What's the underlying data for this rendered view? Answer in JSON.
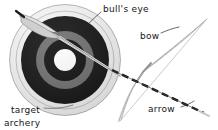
{
  "figure": {
    "caption": "archery",
    "background_color": "#ffffff",
    "text_color": "#141414"
  },
  "labels": {
    "bullseye": "bull's eye",
    "bow": "bow",
    "arrow": "arrow",
    "target": "target"
  },
  "diagram": {
    "title": "archery",
    "type": "labeled-illustration",
    "parts": [
      {
        "name": "target",
        "label": "target",
        "label_position": "bottom-left",
        "description": "concentric ring archery target seen slightly obliquely",
        "center": [
          65,
          60
        ],
        "rings": [
          {
            "name": "outer-edge",
            "radius": 56,
            "color": "#ffffff",
            "stroke": "#8a8a8a"
          },
          {
            "name": "outer-white",
            "radius": 49,
            "color": "#fbfbfb",
            "stroke": "#9a9a9a"
          },
          {
            "name": "outer-black",
            "radius": 44,
            "color": "#111111"
          },
          {
            "name": "mid-gray",
            "radius": 29,
            "color": "#6f6f6f"
          },
          {
            "name": "inner-black",
            "radius": 21,
            "color": "#0d0d0d"
          },
          {
            "name": "bulls-eye-center",
            "radius": 11,
            "color": "#fdfdfd"
          }
        ]
      },
      {
        "name": "bulls-eye",
        "label": "bull's eye",
        "label_position": "top-center",
        "description": "white center circle of the target",
        "leader_from": [
          101,
          13
        ],
        "leader_to": [
          80,
          33
        ]
      },
      {
        "name": "bow",
        "label": "bow",
        "label_position": "upper-right",
        "description": "recurve bow with taut string, drawn in thin outline",
        "leader_from": [
          160,
          34
        ],
        "leader_to": [
          176,
          28
        ],
        "tip_top": [
          207,
          19
        ],
        "tip_bottom": [
          119,
          122
        ],
        "stroke": "#9b9b9b"
      },
      {
        "name": "arrow",
        "label": "arrow",
        "label_position": "bottom-right",
        "description": "arrow with fletching at upper left, banded shaft running diagonally to the point at lower right",
        "leader_from": [
          180,
          108
        ],
        "leader_to": [
          191,
          103
        ],
        "nock_end": [
          17,
          12
        ],
        "point_end": [
          208,
          113
        ],
        "shaft_color": "#111111"
      }
    ]
  }
}
